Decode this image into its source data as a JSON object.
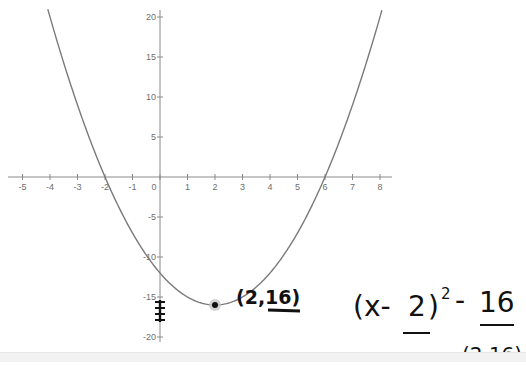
{
  "graph": {
    "function": "y = (x - 2)^2 - 16",
    "x_ticks": [
      "-5",
      "-4",
      "-3",
      "-2",
      "-1",
      "0",
      "1",
      "2",
      "3",
      "4",
      "5",
      "6",
      "7",
      "8"
    ],
    "y_ticks": [
      "20",
      "15",
      "10",
      "5",
      "-5",
      "-10",
      "-15",
      "-20"
    ],
    "vertex_label": "(2,-16)",
    "colors": {
      "axis": "#8a8a8a",
      "curve": "#7a7a7a",
      "point": "#111111",
      "point_halo": "#c8c8c8",
      "ink": "#111111"
    }
  },
  "annotations": {
    "vertex_note": "(2,16)",
    "vertex_form": "(x-2)²-16",
    "vertex_form_parts": {
      "open": "(x-",
      "h": "2",
      "close": ")",
      "exp": "2",
      "minus": "-",
      "k": "16"
    },
    "vertex_bottom": "(2,16)"
  },
  "chart_data": {
    "type": "line",
    "title": "",
    "xlabel": "",
    "ylabel": "",
    "xlim": [
      -5.5,
      8.4
    ],
    "ylim": [
      -21,
      21
    ],
    "grid": false,
    "x_tick_labels": [
      "-5",
      "-4",
      "-3",
      "-2",
      "-1",
      "0",
      "1",
      "2",
      "3",
      "4",
      "5",
      "6",
      "7",
      "8"
    ],
    "y_tick_labels": [
      "-20",
      "-15",
      "-10",
      "-5",
      "5",
      "10",
      "15",
      "20"
    ],
    "series": [
      {
        "name": "y = (x-2)^2 - 16",
        "x": [
          -4.08,
          -4,
          -3,
          -2,
          -1,
          0,
          1,
          2,
          3,
          4,
          5,
          6,
          7,
          8,
          8.08
        ],
        "values": [
          21,
          20,
          9,
          0,
          -7,
          -12,
          -15,
          -16,
          -15,
          -12,
          -7,
          0,
          9,
          20,
          21
        ]
      }
    ],
    "points": [
      {
        "x": 2,
        "y": -16,
        "label": "vertex"
      }
    ],
    "annotations": [
      "(2,16)",
      "(x-2)^2-16",
      "(2,16)"
    ]
  }
}
